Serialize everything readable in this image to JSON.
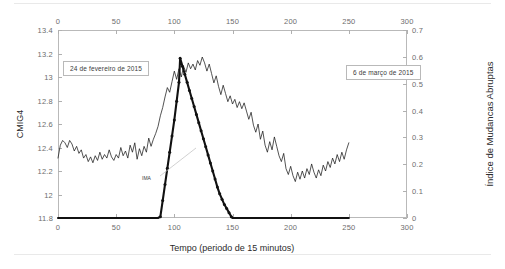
{
  "chart_data": {
    "type": "line",
    "title": "",
    "xlabel": "Tempo (periodo de 15 minutos)",
    "ylabel_left": "CMIG4",
    "ylabel_right": "Índice de Mudancas Abruptas",
    "xlim": [
      0,
      300
    ],
    "ylim_left": [
      11.8,
      13.4
    ],
    "ylim_right": [
      0,
      0.7
    ],
    "grid": false,
    "legend_position": "none",
    "x_ticks_bottom": [
      0,
      50,
      100,
      150,
      200,
      250,
      300
    ],
    "x_ticks_top": [
      0,
      50,
      100,
      150,
      200,
      250,
      300
    ],
    "y_ticks_left": [
      "11.8",
      "12",
      "12.2",
      "12.4",
      "12.6",
      "12.8",
      "13",
      "13.2",
      "13.4"
    ],
    "y_ticks_right": [
      "0",
      "0.1",
      "0.2",
      "0.3",
      "0.4",
      "0.5",
      "0.6",
      "0.7"
    ],
    "annotations": [
      {
        "id": "annotation-fevereiro",
        "text": "24 de fevereiro de 2015"
      },
      {
        "id": "annotation-marco",
        "text": "6 de março de 2015"
      },
      {
        "id": "annotation-index",
        "text": "IMA"
      }
    ],
    "series": [
      {
        "name": "CMIG4",
        "axis": "left",
        "style": "thin-line",
        "color": "#1a1a1a",
        "x": [
          0,
          2,
          4,
          6,
          8,
          10,
          12,
          14,
          16,
          18,
          20,
          22,
          24,
          26,
          28,
          30,
          32,
          34,
          36,
          38,
          40,
          42,
          44,
          46,
          48,
          50,
          52,
          54,
          56,
          58,
          60,
          62,
          64,
          66,
          68,
          70,
          72,
          74,
          76,
          78,
          80,
          82,
          84,
          86,
          88,
          90,
          92,
          94,
          96,
          98,
          100,
          102,
          104,
          106,
          108,
          110,
          112,
          114,
          116,
          118,
          120,
          122,
          124,
          126,
          128,
          130,
          132,
          134,
          136,
          138,
          140,
          142,
          144,
          146,
          148,
          150,
          152,
          154,
          156,
          158,
          160,
          162,
          164,
          166,
          168,
          170,
          172,
          174,
          176,
          178,
          180,
          182,
          184,
          186,
          188,
          190,
          192,
          194,
          196,
          198,
          200,
          202,
          204,
          206,
          208,
          210,
          212,
          214,
          216,
          218,
          220,
          222,
          224,
          226,
          228,
          230,
          232,
          234,
          236,
          238,
          240,
          242,
          244,
          246,
          248,
          250
        ],
        "y": [
          12.31,
          12.42,
          12.46,
          12.44,
          12.4,
          12.46,
          12.43,
          12.37,
          12.41,
          12.35,
          12.38,
          12.31,
          12.34,
          12.28,
          12.32,
          12.27,
          12.33,
          12.29,
          12.36,
          12.3,
          12.34,
          12.31,
          12.38,
          12.32,
          12.29,
          12.34,
          12.31,
          12.4,
          12.33,
          12.37,
          12.31,
          12.42,
          12.36,
          12.44,
          12.3,
          12.39,
          12.33,
          12.41,
          12.36,
          12.48,
          12.41,
          12.47,
          12.52,
          12.58,
          12.67,
          12.74,
          12.83,
          12.91,
          12.87,
          12.96,
          13.05,
          12.98,
          13.07,
          13.0,
          13.09,
          13.04,
          13.12,
          13.07,
          13.11,
          13.06,
          13.14,
          13.1,
          13.17,
          13.12,
          13.05,
          13.11,
          13.03,
          12.95,
          13.01,
          12.92,
          12.85,
          12.93,
          12.86,
          12.79,
          12.84,
          12.77,
          12.81,
          12.74,
          12.79,
          12.73,
          12.78,
          12.71,
          12.64,
          12.7,
          12.59,
          12.53,
          12.6,
          12.47,
          12.54,
          12.42,
          12.36,
          12.45,
          12.38,
          12.49,
          12.41,
          12.33,
          12.28,
          12.35,
          12.22,
          12.17,
          12.24,
          12.16,
          12.11,
          12.19,
          12.13,
          12.2,
          12.14,
          12.22,
          12.17,
          12.26,
          12.19,
          12.14,
          12.21,
          12.16,
          12.25,
          12.2,
          12.28,
          12.23,
          12.31,
          12.26,
          12.34,
          12.28,
          12.36,
          12.3,
          12.38,
          12.44
        ]
      },
      {
        "name": "Índice de Mudancas Abruptas",
        "axis": "right",
        "style": "thick-line-with-markers",
        "color": "#111111",
        "x": [
          0,
          10,
          20,
          30,
          40,
          50,
          60,
          70,
          80,
          86,
          88,
          90,
          92,
          94,
          96,
          98,
          100,
          102,
          104,
          105,
          107,
          109,
          111,
          113,
          115,
          117,
          119,
          121,
          123,
          125,
          127,
          129,
          131,
          133,
          135,
          137,
          139,
          141,
          143,
          145,
          147,
          149,
          150,
          160,
          170,
          180,
          190,
          200,
          210,
          220,
          230,
          240,
          250
        ],
        "y": [
          0.0,
          0.0,
          0.0,
          0.0,
          0.0,
          0.0,
          0.0,
          0.0,
          0.0,
          0.0,
          0.005,
          0.065,
          0.125,
          0.185,
          0.245,
          0.305,
          0.365,
          0.435,
          0.505,
          0.595,
          0.565,
          0.535,
          0.505,
          0.475,
          0.445,
          0.415,
          0.385,
          0.355,
          0.325,
          0.295,
          0.265,
          0.235,
          0.205,
          0.175,
          0.145,
          0.115,
          0.09,
          0.07,
          0.05,
          0.035,
          0.02,
          0.005,
          0.0,
          0.0,
          0.0,
          0.0,
          0.0,
          0.0,
          0.0,
          0.0,
          0.0,
          0.0,
          0.0
        ]
      }
    ]
  }
}
